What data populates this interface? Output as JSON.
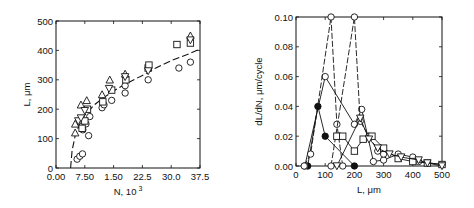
{
  "chart_data": [
    {
      "type": "scatter",
      "title": "",
      "xlabel": "N, 10",
      "xlabel_superscript": "3",
      "ylabel": "L, μm",
      "xlim": [
        0,
        37.5
      ],
      "ylim": [
        0,
        500
      ],
      "xtick_labels": [
        "0.00",
        "7.50",
        "1.50",
        "22.5",
        "30.0",
        "37.5"
      ],
      "xtick_values": [
        0,
        7.5,
        15,
        22.5,
        30,
        37.5
      ],
      "ytick_labels": [
        "0",
        "100",
        "200",
        "300",
        "400",
        "500"
      ],
      "ytick_values": [
        0,
        100,
        200,
        300,
        400,
        500
      ],
      "grid": false,
      "legend": null,
      "series": [
        {
          "name": "circles",
          "marker": "circle",
          "points": [
            [
              5.5,
              30
            ],
            [
              6.2,
              40
            ],
            [
              6.9,
              48
            ],
            [
              7.0,
              130
            ],
            [
              7.8,
              150
            ],
            [
              8.5,
              110
            ],
            [
              8.8,
              175
            ],
            [
              12.0,
              205
            ],
            [
              12.5,
              215
            ],
            [
              14.5,
              230
            ],
            [
              18.0,
              255
            ],
            [
              18.0,
              280
            ],
            [
              24.0,
              300
            ],
            [
              32.0,
              340
            ],
            [
              35.0,
              360
            ]
          ]
        },
        {
          "name": "squares",
          "marker": "square",
          "points": [
            [
              6.8,
              135
            ],
            [
              7.5,
              160
            ],
            [
              8.2,
              200
            ],
            [
              12.2,
              225
            ],
            [
              14.5,
              265
            ],
            [
              18.2,
              300
            ],
            [
              24.0,
              340
            ],
            [
              24.2,
              350
            ],
            [
              31.5,
              420
            ],
            [
              35.0,
              425
            ]
          ]
        },
        {
          "name": "triangles-up",
          "marker": "triangle-up",
          "points": [
            [
              5.0,
              120
            ],
            [
              5.0,
              150
            ],
            [
              6.5,
              215
            ],
            [
              8.0,
              230
            ],
            [
              12.0,
              250
            ],
            [
              14.0,
              300
            ],
            [
              18.0,
              320
            ],
            [
              35.0,
              450
            ]
          ]
        },
        {
          "name": "triangles-down",
          "marker": "triangle-down",
          "points": [
            [
              5.8,
              160
            ],
            [
              6.5,
              170
            ],
            [
              7.5,
              195
            ],
            [
              13.8,
              270
            ],
            [
              18.0,
              310
            ],
            [
              24.0,
              330
            ],
            [
              35.0,
              435
            ]
          ]
        }
      ],
      "fit_curve": {
        "style": "dashed",
        "description": "rises steeply from ~(3.8,0) and flattens to ~400 at N=37.5",
        "points": [
          [
            3.8,
            0
          ],
          [
            4.2,
            60
          ],
          [
            5.0,
            110
          ],
          [
            6.0,
            145
          ],
          [
            7.5,
            180
          ],
          [
            10,
            215
          ],
          [
            12.5,
            240
          ],
          [
            15,
            262
          ],
          [
            18,
            285
          ],
          [
            22.5,
            315
          ],
          [
            26,
            340
          ],
          [
            30,
            365
          ],
          [
            34,
            385
          ],
          [
            37.5,
            405
          ]
        ]
      }
    },
    {
      "type": "line",
      "title": "",
      "xlabel": "L, μm",
      "ylabel": "dL/dN, μm/cycle",
      "xlim": [
        0,
        500
      ],
      "ylim": [
        0,
        0.1
      ],
      "xtick_labels": [
        "0",
        "100",
        "200",
        "300",
        "400",
        "500"
      ],
      "xtick_values": [
        0,
        100,
        200,
        300,
        400,
        500
      ],
      "ytick_labels": [
        "0.00",
        "0.02",
        "0.04",
        "0.06",
        "0.08",
        "0.10"
      ],
      "ytick_values": [
        0,
        0.02,
        0.04,
        0.06,
        0.08,
        0.1
      ],
      "grid": false,
      "legend": null,
      "series": [
        {
          "name": "filled-circles",
          "marker": "filled-circle",
          "style": "solid",
          "points": [
            [
              40,
              0.0
            ],
            [
              75,
              0.04
            ],
            [
              100,
              0.02
            ],
            [
              200,
              0.0
            ]
          ]
        },
        {
          "name": "open-circles-a",
          "marker": "circle",
          "style": "solid",
          "points": [
            [
              30,
              0.0
            ],
            [
              100,
              0.06
            ],
            [
              200,
              0.028
            ],
            [
              225,
              0.038
            ],
            [
              265,
              0.003
            ],
            [
              300,
              0.004
            ],
            [
              350,
              0.008
            ],
            [
              400,
              0.006
            ],
            [
              420,
              0.003
            ],
            [
              500,
              0.001
            ]
          ]
        },
        {
          "name": "open-circles-peak-120",
          "marker": "circle",
          "style": "dashed",
          "points": [
            [
              28,
              0.0
            ],
            [
              50,
              0.008
            ],
            [
              120,
              0.1
            ],
            [
              140,
              0.028
            ],
            [
              160,
              0.0
            ]
          ]
        },
        {
          "name": "open-circles-peak-200",
          "marker": "circle",
          "style": "dashed",
          "points": [
            [
              120,
              0.0
            ],
            [
              200,
              0.1
            ],
            [
              220,
              0.03
            ],
            [
              250,
              0.02
            ],
            [
              280,
              0.01
            ],
            [
              300,
              0.008
            ]
          ]
        },
        {
          "name": "squares",
          "marker": "square",
          "style": "solid",
          "points": [
            [
              140,
              0.02
            ],
            [
              160,
              0.02
            ],
            [
              200,
              0.01
            ],
            [
              230,
              0.018
            ],
            [
              260,
              0.02
            ],
            [
              300,
              0.012
            ],
            [
              350,
              0.005
            ],
            [
              400,
              0.003
            ],
            [
              450,
              0.002
            ],
            [
              500,
              0.001
            ]
          ]
        },
        {
          "name": "triangles",
          "marker": "triangle-down",
          "style": "solid",
          "points": [
            [
              140,
              0.0
            ],
            [
              220,
              0.032
            ],
            [
              250,
              0.018
            ],
            [
              280,
              0.012
            ],
            [
              320,
              0.008
            ],
            [
              360,
              0.006
            ],
            [
              420,
              0.004
            ],
            [
              450,
              0.002
            ],
            [
              500,
              0.0
            ]
          ]
        }
      ]
    }
  ]
}
